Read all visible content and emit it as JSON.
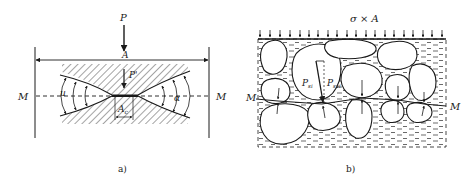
{
  "figure_a": {
    "caption": "a)",
    "load_label": "P",
    "area_label": "A",
    "contact_load_label": "P'",
    "contact_area_label": "A",
    "contact_area_subscript": "c",
    "left_plane_label": "M",
    "right_plane_label": "M",
    "left_angle_label": "u",
    "right_angle_label": "α"
  },
  "figure_b": {
    "caption": "b)",
    "load_label": "σ × A",
    "left_plane_label": "M",
    "right_plane_label": "M",
    "force_label_1": "P",
    "force_label_1_subscript": "si",
    "force_label_2": "P",
    "force_label_2_subscript": "svi"
  },
  "colors": {
    "ink": "#1a1a1a",
    "water_dash": "#2a2a2a",
    "background": "#ffffff"
  }
}
